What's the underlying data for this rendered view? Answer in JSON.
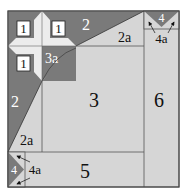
{
  "colors": {
    "background": "#ffffff",
    "light": "#d6d6d6",
    "dark": "#7a7a7a",
    "patch_light": "#e4e4e4",
    "line": "#555555",
    "label_light": "#ffffff",
    "label_dark": "#222222"
  },
  "pieces": {
    "p1_a": "1",
    "p1_b": "1",
    "p1_c": "1",
    "p3a": "3a",
    "p2_top": "2",
    "p2a_top": "2a",
    "p2_left": "2",
    "p2a_left": "2a",
    "p3": "3",
    "p4_top": "4",
    "p4a_top": "4a",
    "p4_bottom": "4",
    "p4a_bottom": "4a",
    "p5": "5",
    "p6": "6"
  }
}
